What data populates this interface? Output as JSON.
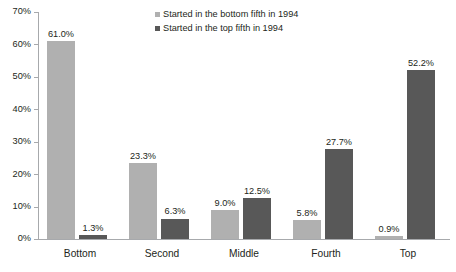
{
  "chart_data": {
    "type": "bar",
    "title": "",
    "subtitle": "",
    "xlabel": "",
    "ylabel": "",
    "ylim": [
      0,
      70
    ],
    "ytick_step": 10,
    "ytick_labels": [
      "0%",
      "10%",
      "20%",
      "30%",
      "40%",
      "50%",
      "60%",
      "70%"
    ],
    "ytick_values": [
      0,
      10,
      20,
      30,
      40,
      50,
      60,
      70
    ],
    "grid": false,
    "legend_position": "top-center",
    "categories": [
      "Bottom",
      "Second",
      "Middle",
      "Fourth",
      "Top"
    ],
    "series": [
      {
        "name": "Started in the bottom fifth in 1994",
        "color": "#b0b0b0",
        "values": [
          61.0,
          23.3,
          9.0,
          5.8,
          0.9
        ],
        "labels": [
          "61.0%",
          "23.3%",
          "9.0%",
          "5.8%",
          "0.9%"
        ]
      },
      {
        "name": "Started in the top fifth in 1994",
        "color": "#585858",
        "values": [
          1.3,
          6.3,
          12.5,
          27.7,
          52.2
        ],
        "labels": [
          "1.3%",
          "6.3%",
          "12.5%",
          "27.7%",
          "52.2%"
        ]
      }
    ]
  },
  "axis": {
    "line_color": "#a7a9ac"
  }
}
